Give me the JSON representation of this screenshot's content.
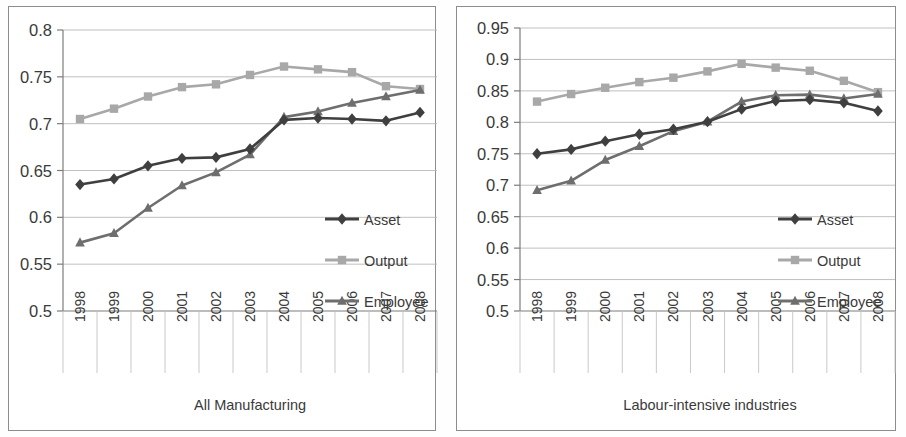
{
  "figure": {
    "background": "#fdfdfc",
    "frame_color": "#8d8d8d"
  },
  "series_style": {
    "asset": {
      "name": "Asset",
      "color": "#3f3f3f",
      "marker": "diamond"
    },
    "output": {
      "name": "Output",
      "color": "#a8a8a8",
      "marker": "square"
    },
    "employee": {
      "name": "Employee",
      "color": "#6e6e6e",
      "marker": "triangle"
    }
  },
  "legend": {
    "items": [
      {
        "label": "Asset"
      },
      {
        "label": "Output"
      },
      {
        "label": "Employee"
      }
    ]
  },
  "chart_data": [
    {
      "type": "line",
      "title": "All Manufacturing",
      "xlabel": "",
      "ylabel": "",
      "categories": [
        "1998",
        "1999",
        "2000",
        "2001",
        "2002",
        "2003",
        "2004",
        "2005",
        "2006",
        "2007",
        "2008"
      ],
      "ylim": [
        0.5,
        0.8
      ],
      "yticks": [
        0.5,
        0.55,
        0.6,
        0.65,
        0.7,
        0.75,
        0.8
      ],
      "ytick_labels": [
        "0.5",
        "0.55",
        "0.6",
        "0.65",
        "0.7",
        "0.75",
        "0.8"
      ],
      "grid": true,
      "legend_position": "center-right",
      "series": [
        {
          "name": "Asset",
          "values": [
            0.635,
            0.641,
            0.655,
            0.663,
            0.664,
            0.673,
            0.704,
            0.706,
            0.705,
            0.703,
            0.712
          ]
        },
        {
          "name": "Output",
          "values": [
            0.705,
            0.716,
            0.729,
            0.739,
            0.742,
            0.752,
            0.761,
            0.758,
            0.755,
            0.74,
            0.737
          ]
        },
        {
          "name": "Employee",
          "values": [
            0.573,
            0.583,
            0.61,
            0.634,
            0.648,
            0.667,
            0.707,
            0.713,
            0.722,
            0.729,
            0.736
          ]
        }
      ]
    },
    {
      "type": "line",
      "title": "Labour-intensive industries",
      "xlabel": "",
      "ylabel": "",
      "categories": [
        "1998",
        "1999",
        "2000",
        "2001",
        "2002",
        "2003",
        "2004",
        "2005",
        "2006",
        "2007",
        "2008"
      ],
      "ylim": [
        0.5,
        0.95
      ],
      "yticks": [
        0.5,
        0.55,
        0.6,
        0.65,
        0.7,
        0.75,
        0.8,
        0.85,
        0.9,
        0.95
      ],
      "ytick_labels": [
        "0.5",
        "0.55",
        "0.6",
        "0.65",
        "0.7",
        "0.75",
        "0.8",
        "0.85",
        "0.9",
        "0.95"
      ],
      "grid": true,
      "legend_position": "center-right",
      "series": [
        {
          "name": "Asset",
          "values": [
            0.75,
            0.757,
            0.77,
            0.781,
            0.789,
            0.801,
            0.821,
            0.834,
            0.836,
            0.831,
            0.818
          ]
        },
        {
          "name": "Output",
          "values": [
            0.833,
            0.845,
            0.855,
            0.864,
            0.871,
            0.881,
            0.893,
            0.887,
            0.882,
            0.866,
            0.848
          ]
        },
        {
          "name": "Employee",
          "values": [
            0.692,
            0.707,
            0.74,
            0.762,
            0.786,
            0.801,
            0.833,
            0.843,
            0.844,
            0.838,
            0.845
          ]
        }
      ]
    }
  ]
}
